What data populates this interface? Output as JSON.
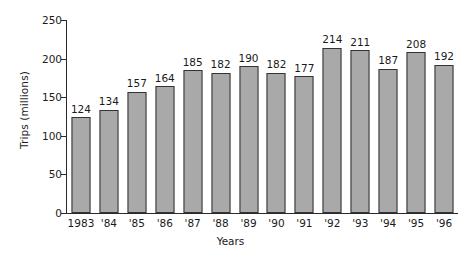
{
  "chart_data": {
    "type": "bar",
    "title": "",
    "xlabel": "Years",
    "ylabel": "Trips (millions)",
    "categories": [
      "1983",
      "'84",
      "'85",
      "'86",
      "'87",
      "'88",
      "'89",
      "'90",
      "'91",
      "'92",
      "'93",
      "'94",
      "'95",
      "'96"
    ],
    "values": [
      124,
      134,
      157,
      164,
      185,
      182,
      190,
      182,
      177,
      214,
      211,
      187,
      208,
      192
    ],
    "value_labels": [
      "124",
      "134",
      "157",
      "164",
      "185",
      "182",
      "190",
      "182",
      "177",
      "214",
      "211",
      "187",
      "208",
      "192"
    ],
    "ylim": [
      0,
      250
    ],
    "ytick_values": [
      0,
      50,
      100,
      150,
      200,
      250
    ],
    "ytick_labels": [
      "0",
      "50",
      "100",
      "150",
      "200",
      "250"
    ],
    "grid": false,
    "legend": false,
    "bar_color": "#a9a9a9",
    "bar_edge_color": "#333333",
    "axis_color": "#2a2a2a",
    "text_color": "#1a1a1a"
  }
}
